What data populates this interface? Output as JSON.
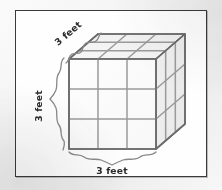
{
  "figure": {
    "type": "geometry-diagram",
    "shape": "cube",
    "subdivision": "3 by 3 by 3 unit cubes",
    "labels": {
      "depth": "3 feet",
      "height": "3 feet",
      "width": "3 feet"
    },
    "dimension_value": "3",
    "dimension_unit": "feet",
    "colors": {
      "frame_border": "#3a3a3a",
      "page_background": "#f3f3f3",
      "figure_background": "#fefefe",
      "cube_edge": "#8c8c8c",
      "cube_outline": "#707070",
      "face_front": "#fcfcfc",
      "face_top": "#f4f4f4",
      "face_right": "#eeeeee",
      "label_text": "#2b2b2b",
      "brace": "#8a8a8a"
    }
  }
}
